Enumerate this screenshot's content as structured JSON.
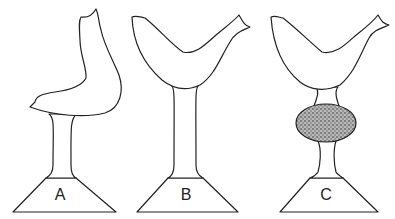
{
  "figure": {
    "panels": [
      {
        "id": "A",
        "label": "A",
        "variant": "bird with raised head, short stem"
      },
      {
        "id": "B",
        "label": "B",
        "variant": "V-shaped bird, long plain stem"
      },
      {
        "id": "C",
        "label": "C",
        "variant": "V-shaped bird, stem with stippled oval knob"
      }
    ]
  },
  "colors": {
    "line": "#222222",
    "background": "#ffffff",
    "stipple": "#555555"
  }
}
